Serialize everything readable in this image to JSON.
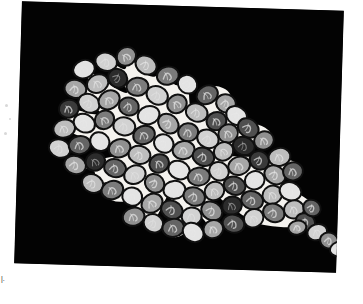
{
  "page": {
    "background_color": "#ffffff",
    "width": 363,
    "height": 304,
    "margin_artifact_left": ",",
    "margin_artifact_bottom": "|."
  },
  "figure_panel": {
    "label": "micrograph-panel",
    "background_color": "#030303",
    "rotation_deg": 1.7,
    "left": 18,
    "top": 6,
    "width": 322,
    "height": 262
  },
  "figure": {
    "type": "micrograph",
    "cluster_shape": "leaf-lens with tapering tail toward lower right",
    "matrix_color": "#f4f2ee",
    "outline_color": "#101010",
    "cell_count": 126,
    "cell_fill_palette": [
      "#3a3a3a",
      "#4f4f4f",
      "#646464",
      "#7b7b7b",
      "#909090",
      "#a6a6a6",
      "#bdbdbd",
      "#d2d2d2",
      "#e4e4e4",
      "#2b2b2b"
    ],
    "cell_ridge_color": "#e8e8e8"
  },
  "chart_data": {
    "type": "scatter",
    "title": "",
    "xlabel": "",
    "ylabel": "",
    "note": "positions are cell centroids in panel coordinates; r = radius px; g = grayscale fill index; a = rotation deg",
    "cells": [
      {
        "x": 64,
        "y": 66,
        "rx": 11,
        "ry": 9,
        "g": 8,
        "a": -22
      },
      {
        "x": 86,
        "y": 58,
        "rx": 11,
        "ry": 9,
        "g": 7,
        "a": 14
      },
      {
        "x": 106,
        "y": 52,
        "rx": 10,
        "ry": 9,
        "g": 4,
        "a": -40
      },
      {
        "x": 126,
        "y": 60,
        "rx": 11,
        "ry": 9,
        "g": 6,
        "a": 28
      },
      {
        "x": 148,
        "y": 70,
        "rx": 11,
        "ry": 9,
        "g": 3,
        "a": -12
      },
      {
        "x": 168,
        "y": 78,
        "rx": 10,
        "ry": 9,
        "g": 8,
        "a": 35
      },
      {
        "x": 188,
        "y": 88,
        "rx": 11,
        "ry": 9,
        "g": 2,
        "a": -30
      },
      {
        "x": 207,
        "y": 96,
        "rx": 10,
        "ry": 9,
        "g": 5,
        "a": 18
      },
      {
        "x": 56,
        "y": 86,
        "rx": 11,
        "ry": 9,
        "g": 5,
        "a": 10
      },
      {
        "x": 78,
        "y": 80,
        "rx": 11,
        "ry": 9,
        "g": 6,
        "a": -25
      },
      {
        "x": 98,
        "y": 74,
        "rx": 10,
        "ry": 9,
        "g": 9,
        "a": 42
      },
      {
        "x": 118,
        "y": 82,
        "rx": 11,
        "ry": 9,
        "g": 3,
        "a": -8
      },
      {
        "x": 138,
        "y": 90,
        "rx": 11,
        "ry": 9,
        "g": 7,
        "a": 22
      },
      {
        "x": 158,
        "y": 98,
        "rx": 10,
        "ry": 9,
        "g": 4,
        "a": -35
      },
      {
        "x": 178,
        "y": 106,
        "rx": 11,
        "ry": 9,
        "g": 6,
        "a": 16
      },
      {
        "x": 198,
        "y": 114,
        "rx": 10,
        "ry": 9,
        "g": 1,
        "a": -20
      },
      {
        "x": 218,
        "y": 108,
        "rx": 11,
        "ry": 9,
        "g": 8,
        "a": 30
      },
      {
        "x": 50,
        "y": 106,
        "rx": 10,
        "ry": 9,
        "g": 0,
        "a": -14
      },
      {
        "x": 70,
        "y": 100,
        "rx": 11,
        "ry": 9,
        "g": 7,
        "a": 26
      },
      {
        "x": 90,
        "y": 96,
        "rx": 11,
        "ry": 9,
        "g": 5,
        "a": -32
      },
      {
        "x": 110,
        "y": 102,
        "rx": 10,
        "ry": 9,
        "g": 2,
        "a": 12
      },
      {
        "x": 130,
        "y": 110,
        "rx": 11,
        "ry": 9,
        "g": 8,
        "a": -18
      },
      {
        "x": 150,
        "y": 118,
        "rx": 11,
        "ry": 9,
        "g": 5,
        "a": 38
      },
      {
        "x": 170,
        "y": 126,
        "rx": 10,
        "ry": 9,
        "g": 3,
        "a": -6
      },
      {
        "x": 190,
        "y": 132,
        "rx": 11,
        "ry": 9,
        "g": 7,
        "a": 20
      },
      {
        "x": 210,
        "y": 126,
        "rx": 10,
        "ry": 9,
        "g": 4,
        "a": -28
      },
      {
        "x": 230,
        "y": 120,
        "rx": 11,
        "ry": 9,
        "g": 1,
        "a": 34
      },
      {
        "x": 46,
        "y": 126,
        "rx": 11,
        "ry": 9,
        "g": 6,
        "a": -16
      },
      {
        "x": 66,
        "y": 120,
        "rx": 11,
        "ry": 9,
        "g": 8,
        "a": 24
      },
      {
        "x": 86,
        "y": 116,
        "rx": 10,
        "ry": 9,
        "g": 3,
        "a": -38
      },
      {
        "x": 106,
        "y": 122,
        "rx": 11,
        "ry": 9,
        "g": 7,
        "a": 8
      },
      {
        "x": 126,
        "y": 130,
        "rx": 11,
        "ry": 9,
        "g": 2,
        "a": -22
      },
      {
        "x": 146,
        "y": 138,
        "rx": 10,
        "ry": 9,
        "g": 8,
        "a": 30
      },
      {
        "x": 166,
        "y": 144,
        "rx": 11,
        "ry": 9,
        "g": 5,
        "a": -10
      },
      {
        "x": 186,
        "y": 150,
        "rx": 11,
        "ry": 9,
        "g": 1,
        "a": 18
      },
      {
        "x": 206,
        "y": 144,
        "rx": 10,
        "ry": 9,
        "g": 6,
        "a": -34
      },
      {
        "x": 226,
        "y": 138,
        "rx": 11,
        "ry": 9,
        "g": 9,
        "a": 14
      },
      {
        "x": 246,
        "y": 132,
        "rx": 10,
        "ry": 9,
        "g": 4,
        "a": -26
      },
      {
        "x": 42,
        "y": 146,
        "rx": 11,
        "ry": 9,
        "g": 7,
        "a": 20
      },
      {
        "x": 62,
        "y": 142,
        "rx": 11,
        "ry": 9,
        "g": 2,
        "a": -12
      },
      {
        "x": 82,
        "y": 138,
        "rx": 10,
        "ry": 9,
        "g": 8,
        "a": 36
      },
      {
        "x": 102,
        "y": 144,
        "rx": 11,
        "ry": 9,
        "g": 4,
        "a": -20
      },
      {
        "x": 122,
        "y": 150,
        "rx": 11,
        "ry": 9,
        "g": 6,
        "a": 10
      },
      {
        "x": 142,
        "y": 158,
        "rx": 10,
        "ry": 9,
        "g": 1,
        "a": -30
      },
      {
        "x": 162,
        "y": 164,
        "rx": 11,
        "ry": 9,
        "g": 8,
        "a": 22
      },
      {
        "x": 182,
        "y": 170,
        "rx": 11,
        "ry": 9,
        "g": 3,
        "a": -8
      },
      {
        "x": 202,
        "y": 164,
        "rx": 10,
        "ry": 9,
        "g": 7,
        "a": 28
      },
      {
        "x": 222,
        "y": 158,
        "rx": 11,
        "ry": 9,
        "g": 5,
        "a": -18
      },
      {
        "x": 242,
        "y": 152,
        "rx": 10,
        "ry": 9,
        "g": 0,
        "a": 32
      },
      {
        "x": 262,
        "y": 148,
        "rx": 11,
        "ry": 9,
        "g": 6,
        "a": -14
      },
      {
        "x": 58,
        "y": 162,
        "rx": 11,
        "ry": 9,
        "g": 5,
        "a": 16
      },
      {
        "x": 78,
        "y": 158,
        "rx": 10,
        "ry": 9,
        "g": 9,
        "a": -32
      },
      {
        "x": 98,
        "y": 164,
        "rx": 11,
        "ry": 9,
        "g": 2,
        "a": 12
      },
      {
        "x": 118,
        "y": 170,
        "rx": 11,
        "ry": 9,
        "g": 7,
        "a": -24
      },
      {
        "x": 138,
        "y": 178,
        "rx": 10,
        "ry": 9,
        "g": 4,
        "a": 34
      },
      {
        "x": 158,
        "y": 184,
        "rx": 11,
        "ry": 9,
        "g": 8,
        "a": -6
      },
      {
        "x": 178,
        "y": 190,
        "rx": 11,
        "ry": 9,
        "g": 3,
        "a": 20
      },
      {
        "x": 198,
        "y": 184,
        "rx": 10,
        "ry": 9,
        "g": 6,
        "a": -30
      },
      {
        "x": 218,
        "y": 178,
        "rx": 11,
        "ry": 9,
        "g": 1,
        "a": 16
      },
      {
        "x": 238,
        "y": 172,
        "rx": 10,
        "ry": 9,
        "g": 8,
        "a": -22
      },
      {
        "x": 258,
        "y": 166,
        "rx": 11,
        "ry": 9,
        "g": 5,
        "a": 28
      },
      {
        "x": 276,
        "y": 162,
        "rx": 10,
        "ry": 9,
        "g": 2,
        "a": -12
      },
      {
        "x": 76,
        "y": 180,
        "rx": 11,
        "ry": 9,
        "g": 6,
        "a": 24
      },
      {
        "x": 96,
        "y": 186,
        "rx": 11,
        "ry": 9,
        "g": 3,
        "a": -18
      },
      {
        "x": 116,
        "y": 192,
        "rx": 10,
        "ry": 9,
        "g": 8,
        "a": 10
      },
      {
        "x": 136,
        "y": 198,
        "rx": 11,
        "ry": 9,
        "g": 5,
        "a": -34
      },
      {
        "x": 156,
        "y": 204,
        "rx": 11,
        "ry": 9,
        "g": 1,
        "a": 22
      },
      {
        "x": 176,
        "y": 210,
        "rx": 10,
        "ry": 9,
        "g": 7,
        "a": -8
      },
      {
        "x": 196,
        "y": 204,
        "rx": 11,
        "ry": 9,
        "g": 4,
        "a": 30
      },
      {
        "x": 216,
        "y": 198,
        "rx": 10,
        "ry": 9,
        "g": 9,
        "a": -20
      },
      {
        "x": 236,
        "y": 192,
        "rx": 11,
        "ry": 9,
        "g": 2,
        "a": 14
      },
      {
        "x": 256,
        "y": 186,
        "rx": 10,
        "ry": 9,
        "g": 6,
        "a": -28
      },
      {
        "x": 274,
        "y": 182,
        "rx": 11,
        "ry": 9,
        "g": 8,
        "a": 18
      },
      {
        "x": 118,
        "y": 212,
        "rx": 11,
        "ry": 9,
        "g": 4,
        "a": -16
      },
      {
        "x": 138,
        "y": 218,
        "rx": 10,
        "ry": 9,
        "g": 7,
        "a": 26
      },
      {
        "x": 158,
        "y": 222,
        "rx": 11,
        "ry": 9,
        "g": 2,
        "a": -10
      },
      {
        "x": 178,
        "y": 226,
        "rx": 11,
        "ry": 9,
        "g": 8,
        "a": 32
      },
      {
        "x": 198,
        "y": 222,
        "rx": 10,
        "ry": 9,
        "g": 5,
        "a": -24
      },
      {
        "x": 218,
        "y": 216,
        "rx": 11,
        "ry": 9,
        "g": 1,
        "a": 12
      },
      {
        "x": 238,
        "y": 210,
        "rx": 10,
        "ry": 9,
        "g": 7,
        "a": -30
      },
      {
        "x": 258,
        "y": 204,
        "rx": 11,
        "ry": 9,
        "g": 3,
        "a": 20
      },
      {
        "x": 278,
        "y": 200,
        "rx": 10,
        "ry": 9,
        "g": 6,
        "a": -14
      },
      {
        "x": 290,
        "y": 212,
        "rx": 10,
        "ry": 8,
        "g": 1,
        "a": 26
      },
      {
        "x": 302,
        "y": 222,
        "rx": 10,
        "ry": 8,
        "g": 7,
        "a": -18
      },
      {
        "x": 314,
        "y": 230,
        "rx": 9,
        "ry": 8,
        "g": 4,
        "a": 14
      },
      {
        "x": 324,
        "y": 238,
        "rx": 9,
        "ry": 7,
        "g": 8,
        "a": -24
      },
      {
        "x": 296,
        "y": 198,
        "rx": 9,
        "ry": 8,
        "g": 2,
        "a": 30
      },
      {
        "x": 282,
        "y": 218,
        "rx": 9,
        "ry": 7,
        "g": 5,
        "a": -12
      }
    ]
  }
}
